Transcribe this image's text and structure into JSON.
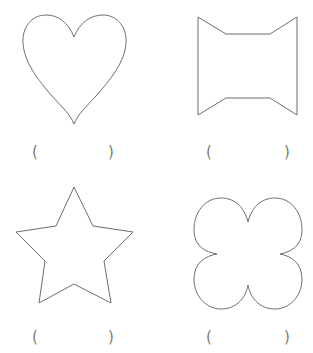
{
  "worksheet": {
    "shapes": [
      {
        "id": "heart",
        "name": "heart",
        "answer": {
          "open": "(",
          "value": "",
          "close": ")"
        }
      },
      {
        "id": "concave-octagon",
        "name": "concave octagon",
        "answer": {
          "open": "(",
          "value": "",
          "close": ")"
        }
      },
      {
        "id": "star",
        "name": "five-pointed star",
        "answer": {
          "open": "(",
          "value": "",
          "close": ")"
        }
      },
      {
        "id": "four-leaf-clover",
        "name": "four-leaf clover",
        "answer": {
          "open": "(",
          "value": "",
          "close": ")"
        }
      }
    ],
    "colors": {
      "stroke": "#6e6e6e",
      "background": "#ffffff",
      "paren": "#7a7a7a"
    }
  }
}
